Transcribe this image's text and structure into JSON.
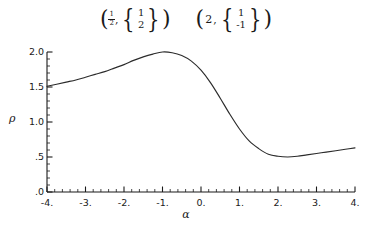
{
  "figure": {
    "background_color": "#ffffff",
    "curve_color": "#2b2b2b",
    "axis_color": "#1a1a1a"
  },
  "annotations": {
    "items": [
      {
        "id": "eigenpair-1",
        "open_paren": "(",
        "eigenvalue_display": "1/2",
        "eigenvalue_numerator": "1",
        "eigenvalue_denominator": "2",
        "comma": ",",
        "open_brace": "{",
        "vector_top": "1",
        "vector_bottom": "2",
        "close_brace": "}",
        "close_paren": ")"
      },
      {
        "id": "eigenpair-2",
        "open_paren": "(",
        "eigenvalue_display": "2",
        "comma": ",",
        "open_brace": "{",
        "vector_top": "1",
        "vector_bottom": "-1",
        "close_brace": "}",
        "close_paren": ")"
      }
    ]
  },
  "cropped_text": {
    "top_rule": "· · · ·",
    "bottom_caption": "· ·· ·   ··  ·· ·  ···   ·· ··  · ·"
  },
  "chart_data": {
    "type": "line",
    "title": "",
    "xlabel": "α",
    "ylabel": "ρ",
    "xlim": [
      -4,
      4
    ],
    "ylim": [
      0,
      2
    ],
    "grid": false,
    "legend": null,
    "xticks": [
      -4,
      -3,
      -2,
      -1,
      0,
      1,
      2,
      3,
      4
    ],
    "xtick_labels": [
      "-4.",
      "-3.",
      "-2.",
      "-1.",
      "0.",
      "1.",
      "2.",
      "3.",
      "4."
    ],
    "xminor_per_interval": 5,
    "yticks": [
      0,
      0.5,
      1.0,
      1.5,
      2.0
    ],
    "ytick_labels": [
      ".0",
      ".5",
      "1.0",
      "1.5",
      "2.0"
    ],
    "yminor_per_interval": 5,
    "series": [
      {
        "name": "rho",
        "x": [
          -4.0,
          -3.75,
          -3.5,
          -3.25,
          -3.0,
          -2.75,
          -2.5,
          -2.25,
          -2.0,
          -1.75,
          -1.5,
          -1.25,
          -1.0,
          -0.75,
          -0.5,
          -0.25,
          0.0,
          0.25,
          0.5,
          0.75,
          1.0,
          1.25,
          1.5,
          1.75,
          2.0,
          2.25,
          2.5,
          2.75,
          3.0,
          3.25,
          3.5,
          3.75,
          4.0
        ],
        "y": [
          1.51,
          1.54,
          1.57,
          1.6,
          1.64,
          1.68,
          1.72,
          1.77,
          1.82,
          1.88,
          1.93,
          1.97,
          2.0,
          1.99,
          1.95,
          1.87,
          1.74,
          1.56,
          1.34,
          1.11,
          0.9,
          0.73,
          0.62,
          0.54,
          0.51,
          0.5,
          0.51,
          0.53,
          0.55,
          0.57,
          0.59,
          0.61,
          0.63
        ]
      }
    ],
    "annotations_on_plot": []
  }
}
